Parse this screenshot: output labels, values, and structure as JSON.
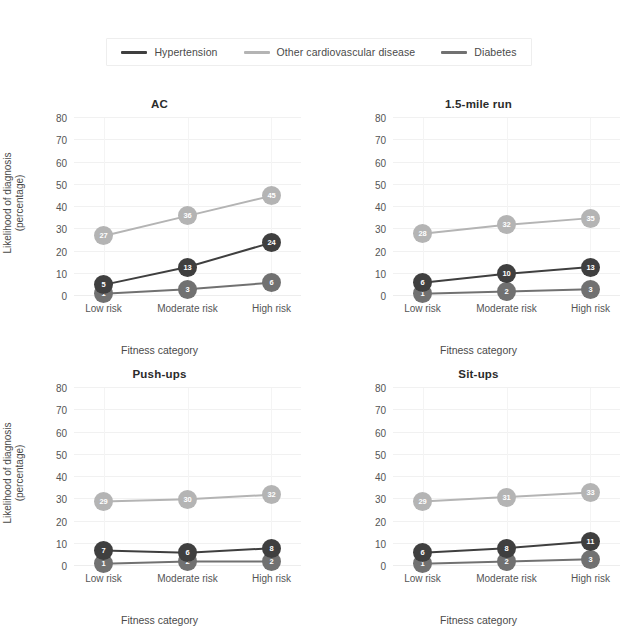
{
  "legend": {
    "position": "top-center",
    "items": [
      {
        "label": "Hypertension",
        "color": "#3f3f3f",
        "swatch_icon": "line-swatch-icon"
      },
      {
        "label": "Other cardiovascular disease",
        "color": "#b4b4b4",
        "swatch_icon": "line-swatch-icon"
      },
      {
        "label": "Diabetes",
        "color": "#717171",
        "swatch_icon": "line-swatch-icon"
      }
    ]
  },
  "axis": {
    "ylabel_line1": "Likelihood of diagnosis",
    "ylabel_line2": "(percentage)",
    "xlabel": "Fitness category",
    "yticks": [
      "0",
      "10",
      "20",
      "30",
      "40",
      "50",
      "60",
      "70",
      "80"
    ],
    "xticks": [
      "Low risk",
      "Moderate risk",
      "High risk"
    ]
  },
  "chart_data": [
    {
      "type": "line",
      "title": "AC",
      "xlabel": "Fitness category",
      "ylabel": "Likelihood of diagnosis (percentage)",
      "categories": [
        "Low risk",
        "Moderate risk",
        "High risk"
      ],
      "ylim": [
        0,
        80
      ],
      "yticks": [
        0,
        10,
        20,
        30,
        40,
        50,
        60,
        70,
        80
      ],
      "grid": true,
      "legend": "top-center",
      "series": [
        {
          "name": "Hypertension",
          "color": "#3f3f3f",
          "values": [
            5,
            13,
            24
          ]
        },
        {
          "name": "Other cardiovascular disease",
          "color": "#b4b4b4",
          "values": [
            27,
            36,
            45
          ]
        },
        {
          "name": "Diabetes",
          "color": "#717171",
          "values": [
            1,
            3,
            6
          ]
        }
      ]
    },
    {
      "type": "line",
      "title": "1.5-mile run",
      "xlabel": "Fitness category",
      "ylabel": "Likelihood of diagnosis (percentage)",
      "categories": [
        "Low risk",
        "Moderate risk",
        "High risk"
      ],
      "ylim": [
        0,
        80
      ],
      "yticks": [
        0,
        10,
        20,
        30,
        40,
        50,
        60,
        70,
        80
      ],
      "grid": true,
      "legend": "top-center",
      "series": [
        {
          "name": "Hypertension",
          "color": "#3f3f3f",
          "values": [
            6,
            10,
            13
          ]
        },
        {
          "name": "Other cardiovascular disease",
          "color": "#b4b4b4",
          "values": [
            28,
            32,
            35
          ]
        },
        {
          "name": "Diabetes",
          "color": "#717171",
          "values": [
            1,
            2,
            3
          ]
        }
      ]
    },
    {
      "type": "line",
      "title": "Push-ups",
      "xlabel": "Fitness category",
      "ylabel": "Likelihood of diagnosis (percentage)",
      "categories": [
        "Low risk",
        "Moderate risk",
        "High risk"
      ],
      "ylim": [
        0,
        80
      ],
      "yticks": [
        0,
        10,
        20,
        30,
        40,
        50,
        60,
        70,
        80
      ],
      "grid": true,
      "legend": "top-center",
      "series": [
        {
          "name": "Hypertension",
          "color": "#3f3f3f",
          "values": [
            7,
            6,
            8
          ]
        },
        {
          "name": "Other cardiovascular disease",
          "color": "#b4b4b4",
          "values": [
            29,
            30,
            32
          ]
        },
        {
          "name": "Diabetes",
          "color": "#717171",
          "values": [
            1,
            2,
            2
          ]
        }
      ]
    },
    {
      "type": "line",
      "title": "Sit-ups",
      "xlabel": "Fitness category",
      "ylabel": "Likelihood of diagnosis (percentage)",
      "categories": [
        "Low risk",
        "Moderate risk",
        "High risk"
      ],
      "ylim": [
        0,
        80
      ],
      "yticks": [
        0,
        10,
        20,
        30,
        40,
        50,
        60,
        70,
        80
      ],
      "grid": true,
      "legend": "top-center",
      "series": [
        {
          "name": "Hypertension",
          "color": "#3f3f3f",
          "values": [
            6,
            8,
            11
          ]
        },
        {
          "name": "Other cardiovascular disease",
          "color": "#b4b4b4",
          "values": [
            29,
            31,
            33
          ]
        },
        {
          "name": "Diabetes",
          "color": "#717171",
          "values": [
            1,
            2,
            3
          ]
        }
      ]
    }
  ]
}
